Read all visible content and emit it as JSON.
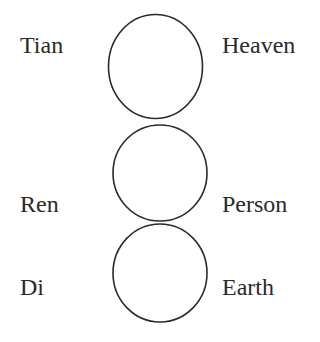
{
  "diagram": {
    "stroke_color": "#2a2a2a",
    "levels": [
      {
        "pinyin": "Tian",
        "english": "Heaven"
      },
      {
        "pinyin": "Ren",
        "english": "Person"
      },
      {
        "pinyin": "Di",
        "english": "Earth"
      }
    ]
  }
}
